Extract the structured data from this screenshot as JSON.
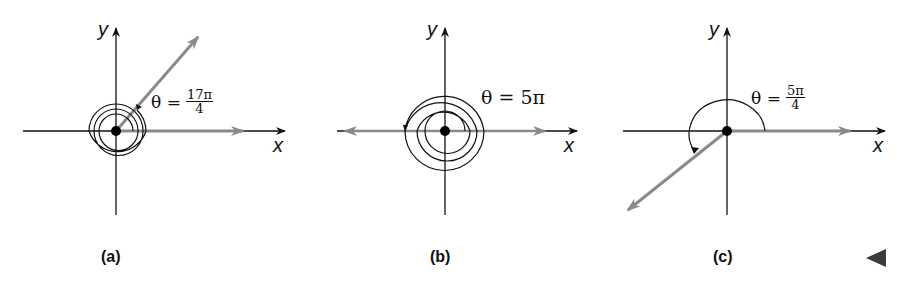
{
  "figure": {
    "panels": [
      {
        "id": "a",
        "caption": "(a)",
        "x_label": "x",
        "y_label": "y",
        "theta_prefix": "θ =",
        "theta_num": "17π",
        "theta_den": "4",
        "theta_text": "",
        "angle_radians": "17π/4",
        "rotations": 2,
        "terminal_side_direction": "first quadrant (π/4)"
      },
      {
        "id": "b",
        "caption": "(b)",
        "x_label": "x",
        "y_label": "y",
        "theta_prefix": "",
        "theta_num": "",
        "theta_den": "",
        "theta_text": "θ = 5π",
        "angle_radians": "5π",
        "rotations": 2.5,
        "terminal_side_direction": "negative x-axis (π)"
      },
      {
        "id": "c",
        "caption": "(c)",
        "x_label": "x",
        "y_label": "y",
        "theta_prefix": "θ =",
        "theta_num": "5π",
        "theta_den": "4",
        "theta_text": "",
        "angle_radians": "5π/4",
        "rotations": 0.625,
        "terminal_side_direction": "third quadrant (5π/4)"
      }
    ],
    "nav_icon": "previous-triangle-icon",
    "colors": {
      "axis": "#111111",
      "terminal_ray": "#8a8a8a",
      "background": "#ffffff"
    }
  }
}
